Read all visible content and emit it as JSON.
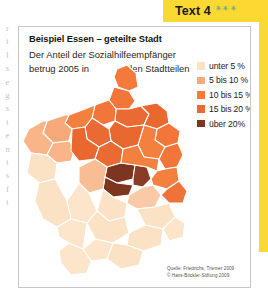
{
  "header": {
    "title": "Text 4",
    "stars": "✳✳✳",
    "star_color": "#3a9e92",
    "background_color": "#fcd832"
  },
  "figure": {
    "title": "Beispiel Essen – geteilte Stadt",
    "subtitle_line1": "Der Anteil der Sozialhilfeempfänger",
    "subtitle_line2": "betrug 2005 in",
    "subtitle_line3": "den Stadtteilen"
  },
  "legend": {
    "items": [
      {
        "label": "unter 5 %",
        "color": "#fbe2c4"
      },
      {
        "label": "5 bis 10 %",
        "color": "#f7a97a"
      },
      {
        "label": "10 bis 15 %",
        "color": "#f47a3c"
      },
      {
        "label": "15 bis 20 %",
        "color": "#ea6a33"
      },
      {
        "label": "über 20%",
        "color": "#7e3520"
      }
    ]
  },
  "source": {
    "line1": "Quelle: Friedrichs, Triemer 2009",
    "line2": "© Hans-Böckler-Stiftung 2009"
  },
  "bleed_text": {
    "characters": [
      "r",
      "t",
      "l",
      "s",
      "e",
      "g",
      "s",
      "t",
      "e",
      "n",
      "t",
      "s",
      "f",
      "t"
    ]
  },
  "map": {
    "description": "Choropleth map of Essen city districts shaded by share of social welfare recipients",
    "districts": [
      {
        "name": "karnap-north-tip",
        "class": "10 bis 15 %",
        "color": "#f47a3c"
      },
      {
        "name": "vogelheim",
        "class": "10 bis 15 %",
        "color": "#f2763a"
      },
      {
        "name": "altenessen-nord",
        "class": "15 bis 20 %",
        "color": "#ea6a33"
      },
      {
        "name": "altenessen-sued",
        "class": "15 bis 20 %",
        "color": "#e8682f"
      },
      {
        "name": "katernberg",
        "class": "15 bis 20 %",
        "color": "#e8682f"
      },
      {
        "name": "schonnebeck",
        "class": "10 bis 15 %",
        "color": "#f2763a"
      },
      {
        "name": "stoppenberg",
        "class": "10 bis 15 %",
        "color": "#f4803f"
      },
      {
        "name": "borbeck-mitte",
        "class": "10 bis 15 %",
        "color": "#f4803f"
      },
      {
        "name": "bochold",
        "class": "15 bis 20 %",
        "color": "#ea6a33"
      },
      {
        "name": "bergeborbeck",
        "class": "10 bis 15 %",
        "color": "#f2763a"
      },
      {
        "name": "dellwig",
        "class": "5 bis 10 %",
        "color": "#f7a97a"
      },
      {
        "name": "frintrop",
        "class": "5 bis 10 %",
        "color": "#f9b488"
      },
      {
        "name": "gerschede",
        "class": "5 bis 10 %",
        "color": "#f9b488"
      },
      {
        "name": "schonebeck",
        "class": "unter 5 %",
        "color": "#fbe2c4"
      },
      {
        "name": "haarzopf",
        "class": "unter 5 %",
        "color": "#fbe2c4"
      },
      {
        "name": "altendorf",
        "class": "15 bis 20 %",
        "color": "#e8682f"
      },
      {
        "name": "holsterhausen",
        "class": "10 bis 15 %",
        "color": "#f4803f"
      },
      {
        "name": "westviertel",
        "class": "15 bis 20 %",
        "color": "#ea6a33"
      },
      {
        "name": "nordviertel",
        "class": "über 20%",
        "color": "#7e3520"
      },
      {
        "name": "ostviertel",
        "class": "über 20%",
        "color": "#8a3c24"
      },
      {
        "name": "sued-innenstadt",
        "class": "über 20%",
        "color": "#7e3520"
      },
      {
        "name": "huttrop",
        "class": "10 bis 15 %",
        "color": "#f4803f"
      },
      {
        "name": "kray",
        "class": "10 bis 15 %",
        "color": "#f2763a"
      },
      {
        "name": "steele",
        "class": "10 bis 15 %",
        "color": "#f4803f"
      },
      {
        "name": "freisenbruch",
        "class": "10 bis 15 %",
        "color": "#ef7339"
      },
      {
        "name": "ruettenscheid",
        "class": "5 bis 10 %",
        "color": "#f9bd95"
      },
      {
        "name": "bergerhausen",
        "class": "5 bis 10 %",
        "color": "#fac9a8"
      },
      {
        "name": "rellinghausen",
        "class": "unter 5 %",
        "color": "#fbe2c4"
      },
      {
        "name": "stadtwald",
        "class": "unter 5 %",
        "color": "#fce5cb"
      },
      {
        "name": "bredeney",
        "class": "unter 5 %",
        "color": "#fbe2c4"
      },
      {
        "name": "werden",
        "class": "unter 5 %",
        "color": "#fce5cb"
      },
      {
        "name": "heidhausen",
        "class": "unter 5 %",
        "color": "#fbe2c4"
      },
      {
        "name": "kettwig",
        "class": "unter 5 %",
        "color": "#fce5cb"
      },
      {
        "name": "fischlaken",
        "class": "unter 5 %",
        "color": "#fbe2c4"
      },
      {
        "name": "burgaltendorf",
        "class": "unter 5 %",
        "color": "#fce5cb"
      },
      {
        "name": "ueberruhr",
        "class": "unter 5 %",
        "color": "#fbe2c4"
      }
    ]
  }
}
